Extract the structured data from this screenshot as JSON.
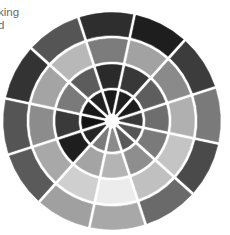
{
  "caption": {
    "lines": [
      "king",
      "d"
    ]
  },
  "wheel": {
    "description": "Grayscale value wheel with 4 concentric rings of 12 segments",
    "segments_per_ring": 12,
    "divider_color": "#ffffff",
    "rings": [
      {
        "name": "outer",
        "colors": [
          "#2e2e2e",
          "#1e1e1e",
          "#3c3c3c",
          "#7a7a7a",
          "#4a4a4a",
          "#6a6a6a",
          "#a8a8a8",
          "#a0a0a0",
          "#5a5a5a",
          "#555555",
          "#333333",
          "#555555"
        ]
      },
      {
        "name": "second",
        "colors": [
          "#7c7c7c",
          "#a2a2a2",
          "#8a8a8a",
          "#b0b0b0",
          "#c4c4c4",
          "#c0c0c0",
          "#ececec",
          "#cfcfcf",
          "#a8a8a8",
          "#8c8c8c",
          "#a4a4a4",
          "#b8b8b8"
        ]
      },
      {
        "name": "third",
        "colors": [
          "#2a2a2a",
          "#383838",
          "#5e5e5e",
          "#6e6e6e",
          "#7a7a7a",
          "#8e8e8e",
          "#b4b4b4",
          "#a4a4a4",
          "#1e1e1e",
          "#3a3a3a",
          "#7a7a7a",
          "#5c5c5c"
        ]
      },
      {
        "name": "inner",
        "colors": [
          "#1a1a1a",
          "#202020",
          "#1c1c1c",
          "#3a3a3a",
          "#555555",
          "#5a5a5a",
          "#8a8a8a",
          "#7a7a7a",
          "#262626",
          "#141414",
          "#181818",
          "#222222"
        ]
      }
    ]
  }
}
